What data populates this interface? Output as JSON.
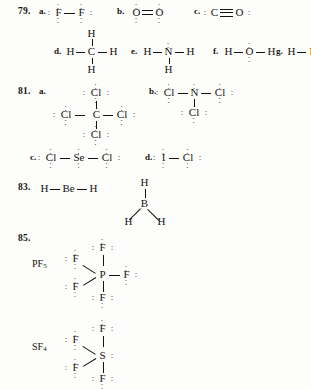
{
  "page": {
    "kind": "chemistry-answer-key",
    "background": "#fdfdfb",
    "ink": "#15130f"
  },
  "problems": [
    {
      "number": "79.",
      "parts": [
        {
          "letter": "a.",
          "species": "F2",
          "center": "F",
          "terminals": [
            "F"
          ]
        },
        {
          "letter": "b.",
          "species": "O2",
          "center": "O",
          "terminals": [
            "O"
          ]
        },
        {
          "letter": "c.",
          "species": "CO",
          "center": "C",
          "terminals": [
            "O"
          ]
        },
        {
          "letter": "d.",
          "species": "CH4",
          "center": "C",
          "terminals": [
            "H",
            "H",
            "H",
            "H"
          ]
        },
        {
          "letter": "e.",
          "species": "NH3",
          "center": "N",
          "terminals": [
            "H",
            "H",
            "H"
          ]
        },
        {
          "letter": "f.",
          "species": "H2O",
          "center": "O",
          "terminals": [
            "H",
            "H"
          ]
        },
        {
          "letter": "g.",
          "species": "HF",
          "center": "F",
          "terminals": [
            "H"
          ]
        }
      ]
    },
    {
      "number": "81.",
      "parts": [
        {
          "letter": "a.",
          "species": "CCl4",
          "center": "C",
          "terminals": [
            "Cl",
            "Cl",
            "Cl",
            "Cl"
          ]
        },
        {
          "letter": "b.",
          "species": "NCl3",
          "center": "N",
          "terminals": [
            "Cl",
            "Cl",
            "Cl"
          ]
        },
        {
          "letter": "c.",
          "species": "SeCl2",
          "center": "Se",
          "terminals": [
            "Cl",
            "Cl"
          ]
        },
        {
          "letter": "d.",
          "species": "ICl",
          "center": "I",
          "terminals": [
            "Cl"
          ]
        }
      ]
    },
    {
      "number": "83.",
      "parts": [
        {
          "letter": "",
          "species": "BeH2",
          "center": "Be",
          "terminals": [
            "H",
            "H"
          ]
        },
        {
          "letter": "",
          "species": "BH3",
          "center": "B",
          "terminals": [
            "H",
            "H",
            "H"
          ]
        }
      ]
    },
    {
      "number": "85.",
      "parts": [
        {
          "letter": "",
          "species": "PF5",
          "label": "PF",
          "sub": "5",
          "center": "P",
          "terminals": [
            "F",
            "F",
            "F",
            "F",
            "F"
          ]
        },
        {
          "letter": "",
          "species": "SF4",
          "label": "SF",
          "sub": "4",
          "center": "S",
          "terminals": [
            "F",
            "F",
            "F",
            "F"
          ]
        }
      ]
    }
  ],
  "atoms": {
    "F": "F",
    "O": "O",
    "C": "C",
    "H": "H",
    "N": "N",
    "Cl": "Cl",
    "Se": "Se",
    "I": "I",
    "Be": "Be",
    "B": "B",
    "P": "P",
    "S": "S"
  },
  "letters": {
    "a": "a.",
    "b": "b.",
    "c": "c.",
    "d": "d.",
    "e": "e.",
    "f": "f.",
    "g": "g."
  },
  "numbers": {
    "n79": "79.",
    "n81": "81.",
    "n83": "83.",
    "n85": "85."
  },
  "labels": {
    "pf5_base": "PF",
    "pf5_sub": "5",
    "sf4_base": "SF",
    "sf4_sub": "4"
  },
  "dots": {
    "pair_h": "· ·",
    "pair_v_a": "·",
    "pair_v_b": "·"
  }
}
